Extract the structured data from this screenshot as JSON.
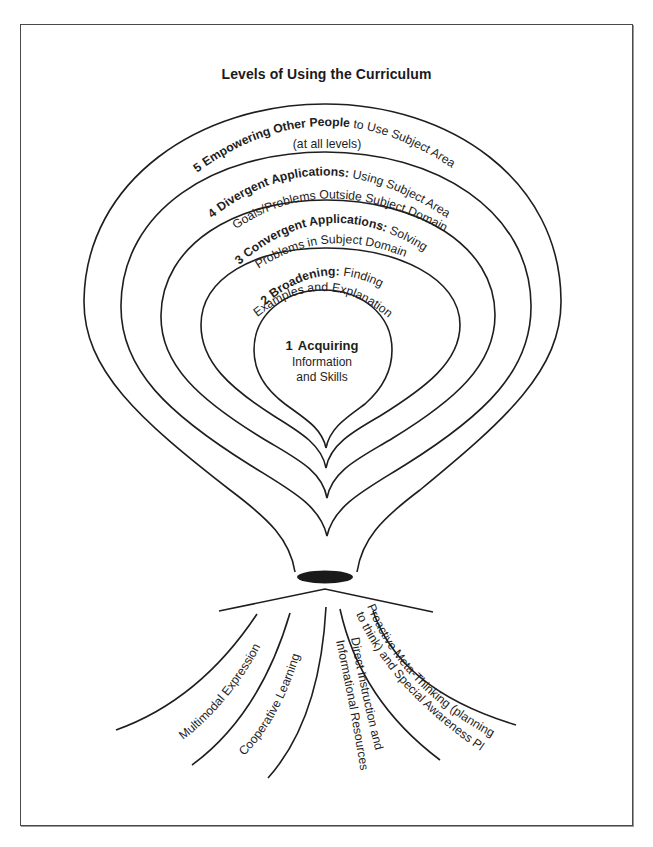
{
  "title": "Levels of Using the Curriculum",
  "levels": [
    {
      "number": "1",
      "name": "Acquiring",
      "line1": "Information",
      "line2": "and Skills"
    },
    {
      "number": "2",
      "name": "Broadening:",
      "rest1": " Finding",
      "line2": "Examples and Explanations"
    },
    {
      "number": "3",
      "name": "Convergent Applications:",
      "rest1": " Solving",
      "line2": "Problems in Subject Domain"
    },
    {
      "number": "4",
      "name": "Divergent Applications:",
      "rest1": " Using Subject Area for",
      "line2": "Goals/Problems Outside Subject Domain"
    },
    {
      "number": "5",
      "name": "Empowering Other People",
      "rest1": " to Use Subject Area",
      "line2": "(at all levels)"
    }
  ],
  "roots": [
    {
      "label": "Multimodal Expression"
    },
    {
      "label": "Cooperative Learning"
    },
    {
      "label": "Direct Instruction and",
      "label2": "Informational Resources"
    },
    {
      "label": "Proactive Meta-Thinking (planning how",
      "label2": "to think) and Special Awareness Plans"
    }
  ],
  "colors": {
    "ink": "#1e1e1e",
    "background": "#ffffff",
    "frame": "#4a4a4a"
  }
}
